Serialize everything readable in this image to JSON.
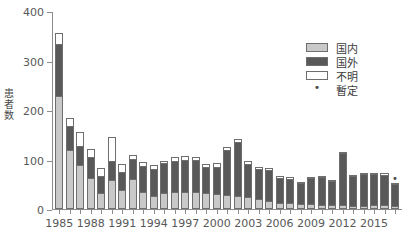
{
  "chart_data": {
    "type": "bar",
    "stacked": true,
    "title": "",
    "xlabel": "",
    "ylabel": "患者数",
    "ylim": [
      0,
      400
    ],
    "yticks": [
      0,
      100,
      200,
      300,
      400
    ],
    "xtick_labels": [
      "1985",
      "1988",
      "1991",
      "1994",
      "1997",
      "2000",
      "2003",
      "2006",
      "2009",
      "2012",
      "2015"
    ],
    "xtick_years": [
      1985,
      1988,
      1991,
      1994,
      1997,
      2000,
      2003,
      2006,
      2009,
      2012,
      2015
    ],
    "grid": false,
    "legend_position": "top-right",
    "legend": [
      "国内",
      "国外",
      "不明",
      "暫定"
    ],
    "series": [
      {
        "name": "国内",
        "color": "#c9c9c9",
        "values": [
          228,
          120,
          88,
          63,
          33,
          58,
          38,
          60,
          35,
          26,
          32,
          35,
          35,
          35,
          33,
          30,
          28,
          27,
          25,
          20,
          16,
          13,
          12,
          10,
          10,
          9,
          8,
          8,
          6,
          7,
          8,
          9,
          6
        ]
      },
      {
        "name": "国外",
        "color": "#595959",
        "values": [
          105,
          48,
          40,
          43,
          33,
          40,
          37,
          42,
          52,
          55,
          60,
          62,
          65,
          65,
          52,
          55,
          92,
          108,
          65,
          60,
          62,
          50,
          48,
          42,
          52,
          55,
          48,
          105,
          60,
          63,
          62,
          60,
          44
        ]
      },
      {
        "name": "不明",
        "color": "#ffffff",
        "values": [
          22,
          15,
          28,
          16,
          17,
          47,
          16,
          8,
          8,
          7,
          6,
          8,
          7,
          6,
          6,
          7,
          6,
          6,
          6,
          5,
          5,
          4,
          4,
          3,
          3,
          3,
          3,
          2,
          3,
          3,
          3,
          3,
          2
        ]
      }
    ],
    "years": [
      1985,
      1986,
      1987,
      1988,
      1989,
      1990,
      1991,
      1992,
      1993,
      1994,
      1995,
      1996,
      1997,
      1998,
      1999,
      2000,
      2001,
      2002,
      2003,
      2004,
      2005,
      2006,
      2007,
      2008,
      2009,
      2010,
      2011,
      2012,
      2013,
      2014,
      2015,
      2016,
      2017
    ],
    "totals": [
      355,
      183,
      156,
      122,
      83,
      145,
      91,
      110,
      95,
      88,
      98,
      105,
      107,
      106,
      91,
      92,
      126,
      141,
      96,
      85,
      83,
      67,
      64,
      55,
      65,
      67,
      59,
      115,
      69,
      73,
      73,
      72,
      52
    ],
    "provisional_marker": "•",
    "provisional_years": [
      2017
    ],
    "annotations": []
  },
  "legend": {
    "items": [
      {
        "label": "国内",
        "swatch": "domestic-swatch"
      },
      {
        "label": "国外",
        "swatch": "foreign-swatch"
      },
      {
        "label": "不明",
        "swatch": "unknown-swatch"
      },
      {
        "label": "暫定",
        "swatch": "provisional-marker"
      }
    ]
  },
  "colors": {
    "domestic": "#c9c9c9",
    "foreign": "#595959",
    "unknown": "#ffffff",
    "axis": "#8c8c8c",
    "text": "#585858",
    "bar_outline": "#6e6e6e"
  }
}
